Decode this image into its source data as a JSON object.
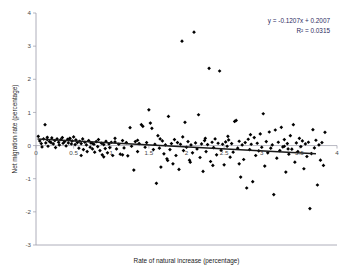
{
  "chart_data": {
    "type": "scatter",
    "title": "",
    "xlabel": "Rate of natural increase (percentage)",
    "ylabel": "Net migration rate (percentage)",
    "xlim": [
      0,
      4
    ],
    "ylim": [
      -3,
      4
    ],
    "xticks": [
      0,
      0.5,
      1,
      1.5,
      2,
      2.5,
      3,
      3.5,
      4
    ],
    "xtick_labels": [
      "0",
      "0.5",
      "1",
      "1.5",
      "2",
      "2.5",
      "3",
      "3.5",
      "4"
    ],
    "yticks": [
      -3,
      -2,
      -1,
      0,
      1,
      2,
      3,
      4
    ],
    "ytick_labels": [
      "-3",
      "-2",
      "-1",
      "0",
      "1",
      "2",
      "3",
      "4"
    ],
    "grid": false,
    "legend": "none",
    "marker_color": "#000000",
    "trendline_color": "#1a1a1a",
    "annotations": {
      "equation": "y = -0.1207x + 0.2007",
      "r_squared": "R² = 0.0315",
      "slope": -0.1207,
      "intercept": 0.2007,
      "r2_value": 0.0315
    },
    "trendline": {
      "x_start": 0.02,
      "x_end": 3.72,
      "y_start": 0.198,
      "y_end": -0.248
    },
    "points": [
      [
        0.03,
        0.28
      ],
      [
        0.05,
        0.14
      ],
      [
        0.07,
        0.06
      ],
      [
        0.08,
        -0.04
      ],
      [
        0.1,
        0.2
      ],
      [
        0.12,
        0.63
      ],
      [
        0.13,
        0.08
      ],
      [
        0.15,
        0.18
      ],
      [
        0.16,
        -0.02
      ],
      [
        0.18,
        0.12
      ],
      [
        0.2,
        0.09
      ],
      [
        0.21,
        0.23
      ],
      [
        0.23,
        0.05
      ],
      [
        0.25,
        0.15
      ],
      [
        0.26,
        -0.06
      ],
      [
        0.28,
        0.2
      ],
      [
        0.3,
        0.1
      ],
      [
        0.31,
        0.02
      ],
      [
        0.33,
        0.18
      ],
      [
        0.35,
        0.24
      ],
      [
        0.36,
        0.07
      ],
      [
        0.38,
        0.12
      ],
      [
        0.4,
        -0.01
      ],
      [
        0.42,
        0.19
      ],
      [
        0.43,
        0.08
      ],
      [
        0.45,
        0.22
      ],
      [
        0.47,
        0.05
      ],
      [
        0.48,
        0.14
      ],
      [
        0.5,
        0.26
      ],
      [
        0.52,
        0.03
      ],
      [
        0.53,
        0.17
      ],
      [
        0.55,
        0.09
      ],
      [
        0.57,
        -0.08
      ],
      [
        0.58,
        0.13
      ],
      [
        0.6,
        0.06
      ],
      [
        0.62,
        0.2
      ],
      [
        0.63,
        -0.12
      ],
      [
        0.65,
        0.1
      ],
      [
        0.67,
        0.02
      ],
      [
        0.68,
        -0.18
      ],
      [
        0.7,
        0.15
      ],
      [
        0.72,
        -0.05
      ],
      [
        0.73,
        0.08
      ],
      [
        0.75,
        -0.1
      ],
      [
        0.77,
        0.04
      ],
      [
        0.78,
        -0.2
      ],
      [
        0.8,
        0.12
      ],
      [
        0.82,
        -0.03
      ],
      [
        0.83,
        0.18
      ],
      [
        0.85,
        -0.15
      ],
      [
        0.87,
        0.07
      ],
      [
        0.88,
        -0.28
      ],
      [
        0.9,
        0.03
      ],
      [
        0.92,
        -0.09
      ],
      [
        0.93,
        0.13
      ],
      [
        0.95,
        -0.22
      ],
      [
        0.97,
        0.05
      ],
      [
        0.98,
        -0.06
      ],
      [
        1.0,
        0.1
      ],
      [
        1.02,
        -0.3
      ],
      [
        1.05,
        0.22
      ],
      [
        1.07,
        -0.1
      ],
      [
        1.1,
        0.04
      ],
      [
        1.12,
        -0.26
      ],
      [
        1.15,
        0.15
      ],
      [
        1.17,
        -0.07
      ],
      [
        1.2,
        0.09
      ],
      [
        1.22,
        -0.31
      ],
      [
        1.25,
        0.54
      ],
      [
        1.27,
        -0.02
      ],
      [
        1.3,
        -0.74
      ],
      [
        1.32,
        0.12
      ],
      [
        1.35,
        -0.18
      ],
      [
        1.37,
        0.06
      ],
      [
        1.4,
        0.63
      ],
      [
        1.42,
        0.58
      ],
      [
        1.45,
        -0.05
      ],
      [
        1.47,
        0.09
      ],
      [
        1.5,
        1.08
      ],
      [
        1.52,
        0.68
      ],
      [
        1.54,
        0.52
      ],
      [
        1.56,
        -0.12
      ],
      [
        1.58,
        0.04
      ],
      [
        1.6,
        -1.14
      ],
      [
        1.62,
        0.3
      ],
      [
        1.64,
        -0.08
      ],
      [
        1.66,
        -0.65
      ],
      [
        1.68,
        0.14
      ],
      [
        1.7,
        -0.25
      ],
      [
        1.72,
        0.02
      ],
      [
        1.74,
        -0.4
      ],
      [
        1.76,
        0.88
      ],
      [
        1.78,
        -0.12
      ],
      [
        1.8,
        0.06
      ],
      [
        1.82,
        -0.55
      ],
      [
        1.84,
        0.18
      ],
      [
        1.86,
        -0.3
      ],
      [
        1.88,
        0.09
      ],
      [
        1.9,
        -0.72
      ],
      [
        1.92,
        0.04
      ],
      [
        1.94,
        3.15
      ],
      [
        1.96,
        -0.15
      ],
      [
        1.98,
        0.7
      ],
      [
        2.0,
        -0.05
      ],
      [
        2.02,
        0.12
      ],
      [
        2.04,
        -0.44
      ],
      [
        2.06,
        0.02
      ],
      [
        2.08,
        -0.22
      ],
      [
        2.1,
        3.42
      ],
      [
        2.12,
        0.08
      ],
      [
        2.14,
        -0.1
      ],
      [
        2.16,
        0.93
      ],
      [
        2.18,
        -0.36
      ],
      [
        2.2,
        0.05
      ],
      [
        2.22,
        -0.78
      ],
      [
        2.24,
        0.15
      ],
      [
        2.26,
        -0.18
      ],
      [
        2.28,
        0.03
      ],
      [
        2.3,
        2.33
      ],
      [
        2.32,
        -0.48
      ],
      [
        2.34,
        0.1
      ],
      [
        2.36,
        -0.06
      ],
      [
        2.38,
        0.2
      ],
      [
        2.4,
        -0.28
      ],
      [
        2.42,
        0.07
      ],
      [
        2.44,
        2.25
      ],
      [
        2.46,
        -0.14
      ],
      [
        2.48,
        0.04
      ],
      [
        2.5,
        -0.58
      ],
      [
        2.52,
        0.11
      ],
      [
        2.54,
        -0.02
      ],
      [
        2.56,
        0.17
      ],
      [
        2.58,
        -0.35
      ],
      [
        2.6,
        0.06
      ],
      [
        2.62,
        -0.2
      ],
      [
        2.64,
        0.73
      ],
      [
        2.66,
        0.76
      ],
      [
        2.68,
        -0.08
      ],
      [
        2.7,
        0.13
      ],
      [
        2.72,
        -0.95
      ],
      [
        2.74,
        0.02
      ],
      [
        2.76,
        -0.42
      ],
      [
        2.78,
        0.09
      ],
      [
        2.8,
        -1.28
      ],
      [
        2.82,
        0.19
      ],
      [
        2.84,
        -0.12
      ],
      [
        2.86,
        0.04
      ],
      [
        2.88,
        -1.09
      ],
      [
        2.9,
        0.24
      ],
      [
        2.92,
        -0.3
      ],
      [
        2.94,
        0.07
      ],
      [
        2.96,
        -0.16
      ],
      [
        2.98,
        0.35
      ],
      [
        3.0,
        -0.05
      ],
      [
        3.02,
        0.96
      ],
      [
        3.04,
        -0.62
      ],
      [
        3.06,
        0.12
      ],
      [
        3.08,
        -0.22
      ],
      [
        3.1,
        0.41
      ],
      [
        3.12,
        -0.08
      ],
      [
        3.14,
        0.02
      ],
      [
        3.16,
        -1.48
      ],
      [
        3.18,
        0.47
      ],
      [
        3.2,
        -0.38
      ],
      [
        3.22,
        0.1
      ],
      [
        3.24,
        -0.15
      ],
      [
        3.26,
        0.55
      ],
      [
        3.28,
        -0.04
      ],
      [
        3.3,
        0.18
      ],
      [
        3.32,
        -0.8
      ],
      [
        3.34,
        0.06
      ],
      [
        3.36,
        -0.26
      ],
      [
        3.38,
        0.3
      ],
      [
        3.4,
        -0.11
      ],
      [
        3.42,
        0.63
      ],
      [
        3.44,
        -0.5
      ],
      [
        3.46,
        0.08
      ],
      [
        3.48,
        -0.18
      ],
      [
        3.5,
        0.22
      ],
      [
        3.52,
        -0.03
      ],
      [
        3.54,
        0.14
      ],
      [
        3.56,
        -0.7
      ],
      [
        3.58,
        0.05
      ],
      [
        3.6,
        -0.33
      ],
      [
        3.62,
        0.1
      ],
      [
        3.64,
        -1.9
      ],
      [
        3.66,
        -0.24
      ],
      [
        3.68,
        0.48
      ],
      [
        3.7,
        -0.07
      ],
      [
        3.72,
        0.16
      ],
      [
        3.74,
        -1.19
      ],
      [
        3.76,
        0.02
      ],
      [
        3.78,
        -0.44
      ],
      [
        3.8,
        0.09
      ],
      [
        3.82,
        -0.6
      ],
      [
        3.84,
        0.4
      ],
      [
        3.3,
        -0.02
      ],
      [
        3.35,
        -0.1
      ],
      [
        2.85,
        0.33
      ],
      [
        2.55,
        0.28
      ],
      [
        2.25,
        0.22
      ],
      [
        1.95,
        0.26
      ],
      [
        1.65,
        0.2
      ],
      [
        1.35,
        0.16
      ],
      [
        1.05,
        0.11
      ],
      [
        0.75,
        0.07
      ],
      [
        0.45,
        0.21
      ],
      [
        0.15,
        0.25
      ],
      [
        2.7,
        -0.55
      ],
      [
        2.35,
        -0.6
      ],
      [
        2.05,
        -0.5
      ],
      [
        1.75,
        -0.45
      ],
      [
        0.6,
        -0.3
      ],
      [
        0.9,
        -0.34
      ],
      [
        1.15,
        -0.28
      ]
    ]
  }
}
